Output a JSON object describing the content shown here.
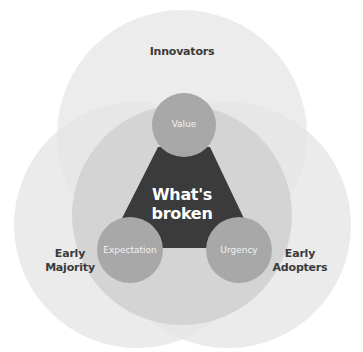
{
  "diagram": {
    "outer_circles": [
      {
        "id": "innovators",
        "label": "Innovators"
      },
      {
        "id": "early-majority",
        "label": "Early Majority",
        "lines": [
          "Early",
          "Majority"
        ]
      },
      {
        "id": "early-adopters",
        "label": "Early Adopters",
        "lines": [
          "Early",
          "Adopters"
        ]
      }
    ],
    "center": {
      "label": "What's broken",
      "lines": [
        "What's",
        "broken"
      ]
    },
    "nodes": [
      {
        "id": "value",
        "label": "Value"
      },
      {
        "id": "expectation",
        "label": "Expectation"
      },
      {
        "id": "urgency",
        "label": "Urgency"
      }
    ],
    "colors": {
      "outer": "#e6e6e6",
      "inner": "#d2d2d2",
      "node": "#a6a6a6",
      "triangle": "#3b3b3b",
      "label": "#3a3a3a"
    }
  }
}
